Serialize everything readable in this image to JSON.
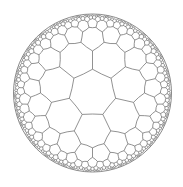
{
  "diagram": {
    "tiling": {
      "p": 7,
      "q": 3,
      "max_depth": 5,
      "min_screen_size": 1.2
    },
    "disk": {
      "cx": 92.5,
      "cy": 93,
      "r": 79
    },
    "rotation_deg": -90,
    "colors": {
      "background": "#ffffff",
      "edge": "#6e6e6e",
      "boundary": "#7a7a7a"
    },
    "stroke": {
      "edge": 0.75,
      "boundary": 0.9
    }
  }
}
